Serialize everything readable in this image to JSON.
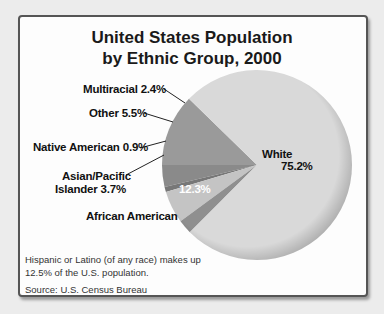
{
  "chart_data": {
    "type": "pie",
    "title": "United States Population by Ethnic Group, 2000",
    "title_lines": [
      "United States Population",
      "by Ethnic Group, 2000"
    ],
    "slices": [
      {
        "label": "White",
        "value": 75.2,
        "display": "75.2%",
        "color": "#d9d9d9"
      },
      {
        "label": "African American",
        "value": 12.3,
        "display": "12.3%",
        "color": "#9a9a9a"
      },
      {
        "label": "Asian/Pacific Islander",
        "value": 3.7,
        "display": "3.7%",
        "color": "#8a8a8a"
      },
      {
        "label": "Native American",
        "value": 0.9,
        "display": "0.9%",
        "color": "#777777"
      },
      {
        "label": "Other",
        "value": 5.5,
        "display": "5.5%",
        "color": "#c4c4c4"
      },
      {
        "label": "Multiracial",
        "value": 2.4,
        "display": "2.4%",
        "color": "#8f8f8f"
      }
    ],
    "note": "Hispanic or Latino (of any race) makes up 12.5% of the U.S. population.",
    "source": "Source: U.S. Census Bureau"
  },
  "labels": {
    "multiracial": "Multiracial  2.4%",
    "other": "Other  5.5%",
    "native": "Native American  0.9%",
    "asian_1": "Asian/Pacific",
    "asian_2": "Islander  3.7%",
    "african": "African American",
    "african_pct": "12.3%",
    "white": "White",
    "white_pct": "75.2%"
  }
}
